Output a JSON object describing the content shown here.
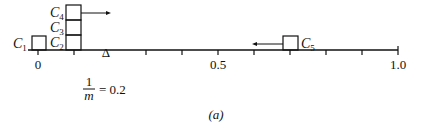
{
  "figure": {
    "caption": "(a)",
    "annotation": {
      "numerator": "1",
      "denominator": "m",
      "rhs": "= 0.2",
      "value": 0.2
    }
  },
  "axis": {
    "min": 0,
    "max": 1.0,
    "tick_step": 0.1,
    "tick_labels": [
      {
        "value": 0,
        "label": "0"
      },
      {
        "value": 0.5,
        "label": "0.5"
      },
      {
        "value": 1.0,
        "label": "1.0"
      }
    ],
    "marker": {
      "value": 0.2,
      "symbol": "Δ"
    }
  },
  "clusters": [
    {
      "name": "C",
      "sub": "1",
      "position": 0.0,
      "stack_level": 0,
      "arrow": null
    },
    {
      "name": "C",
      "sub": "2",
      "position": 0.1,
      "stack_level": 0,
      "arrow": null
    },
    {
      "name": "C",
      "sub": "3",
      "position": 0.1,
      "stack_level": 1,
      "arrow": null
    },
    {
      "name": "C",
      "sub": "4",
      "position": 0.1,
      "stack_level": 2,
      "arrow": "right"
    },
    {
      "name": "C",
      "sub": "5",
      "position": 0.7,
      "stack_level": 0,
      "arrow": "left"
    }
  ]
}
